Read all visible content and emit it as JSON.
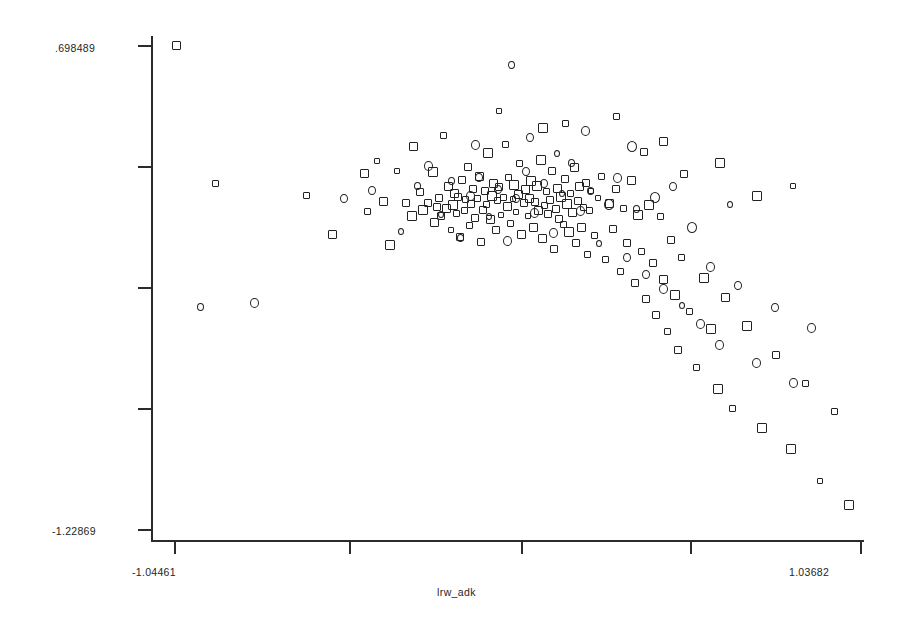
{
  "chart_data": {
    "type": "scatter",
    "title": "",
    "xlabel": "lrw_adk",
    "ylabel": "",
    "xlim": [
      -1.04461,
      1.03682
    ],
    "ylim": [
      -1.22869,
      0.698489
    ],
    "grid": false,
    "legend": "none",
    "x_tick_labels": [
      "-1.04461",
      "1.03682"
    ],
    "y_tick_labels": [
      ".698489",
      "-1.22869"
    ],
    "x_tick_count": 5,
    "y_tick_count": 5,
    "series": [
      {
        "name": "square-markers",
        "marker": "open-square",
        "points": [
          [
            -1.038,
            0.696
          ],
          [
            -0.92,
            0.149
          ],
          [
            -0.642,
            0.099
          ],
          [
            -0.565,
            -0.056
          ],
          [
            -0.468,
            0.185
          ],
          [
            -0.457,
            0.036
          ],
          [
            -0.428,
            0.238
          ],
          [
            -0.41,
            0.076
          ],
          [
            -0.389,
            -0.098
          ],
          [
            -0.368,
            0.198
          ],
          [
            -0.34,
            0.07
          ],
          [
            -0.321,
            0.018
          ],
          [
            -0.318,
            0.296
          ],
          [
            -0.299,
            0.115
          ],
          [
            -0.288,
            0.042
          ],
          [
            -0.274,
            0.071
          ],
          [
            -0.26,
            0.193
          ],
          [
            -0.254,
            -0.01
          ],
          [
            -0.248,
            0.054
          ],
          [
            -0.241,
            0.088
          ],
          [
            -0.233,
            0.017
          ],
          [
            -0.227,
            0.339
          ],
          [
            -0.218,
            0.049
          ],
          [
            -0.212,
            0.137
          ],
          [
            -0.205,
            -0.04
          ],
          [
            -0.198,
            0.06
          ],
          [
            -0.193,
            0.109
          ],
          [
            -0.188,
            0.029
          ],
          [
            -0.182,
            0.095
          ],
          [
            -0.176,
            -0.067
          ],
          [
            -0.17,
            0.161
          ],
          [
            -0.164,
            0.04
          ],
          [
            -0.159,
            0.082
          ],
          [
            -0.153,
            0.212
          ],
          [
            -0.148,
            -0.021
          ],
          [
            -0.142,
            0.066
          ],
          [
            -0.136,
            0.127
          ],
          [
            -0.131,
            0.011
          ],
          [
            -0.125,
            0.088
          ],
          [
            -0.119,
            0.175
          ],
          [
            -0.114,
            -0.084
          ],
          [
            -0.108,
            0.043
          ],
          [
            -0.102,
            0.118
          ],
          [
            -0.097,
            0.065
          ],
          [
            -0.091,
            0.269
          ],
          [
            -0.085,
            0.005
          ],
          [
            -0.08,
            0.097
          ],
          [
            -0.074,
            0.146
          ],
          [
            -0.068,
            -0.038
          ],
          [
            -0.063,
            0.079
          ],
          [
            -0.057,
            0.133
          ],
          [
            -0.051,
            0.022
          ],
          [
            -0.046,
            0.091
          ],
          [
            -0.04,
            0.301
          ],
          [
            -0.034,
            0.056
          ],
          [
            -0.029,
            0.169
          ],
          [
            -0.023,
            -0.012
          ],
          [
            -0.017,
            0.084
          ],
          [
            -0.012,
            0.142
          ],
          [
            -0.006,
            0.033
          ],
          [
            0.0,
            0.102
          ],
          [
            0.005,
            0.225
          ],
          [
            0.011,
            -0.055
          ],
          [
            0.017,
            0.068
          ],
          [
            0.022,
            0.124
          ],
          [
            0.028,
            0.016
          ],
          [
            0.034,
            0.087
          ],
          [
            0.039,
            0.158
          ],
          [
            0.045,
            -0.029
          ],
          [
            0.051,
            0.072
          ],
          [
            0.056,
            0.136
          ],
          [
            0.062,
            0.039
          ],
          [
            0.068,
            0.241
          ],
          [
            0.073,
            -0.073
          ],
          [
            0.079,
            0.059
          ],
          [
            0.085,
            0.115
          ],
          [
            0.09,
            0.024
          ],
          [
            0.096,
            0.081
          ],
          [
            0.102,
            0.197
          ],
          [
            0.107,
            -0.112
          ],
          [
            0.113,
            0.047
          ],
          [
            0.119,
            0.129
          ],
          [
            0.124,
            0.005
          ],
          [
            0.13,
            0.093
          ],
          [
            0.136,
            -0.018
          ],
          [
            0.141,
            0.163
          ],
          [
            0.147,
            0.064
          ],
          [
            0.153,
            -0.046
          ],
          [
            0.158,
            0.108
          ],
          [
            0.164,
            0.032
          ],
          [
            0.17,
            0.21
          ],
          [
            0.175,
            -0.091
          ],
          [
            0.181,
            0.076
          ],
          [
            0.187,
            0.135
          ],
          [
            0.192,
            -0.027
          ],
          [
            0.198,
            0.053
          ],
          [
            0.204,
            0.149
          ],
          [
            0.209,
            -0.134
          ],
          [
            0.215,
            0.041
          ],
          [
            0.221,
            0.118
          ],
          [
            0.232,
            -0.062
          ],
          [
            0.243,
            0.088
          ],
          [
            0.254,
            0.174
          ],
          [
            0.265,
            -0.157
          ],
          [
            0.276,
            0.069
          ],
          [
            0.287,
            -0.035
          ],
          [
            0.298,
            0.125
          ],
          [
            0.309,
            -0.204
          ],
          [
            0.32,
            0.046
          ],
          [
            0.331,
            -0.088
          ],
          [
            0.342,
            0.159
          ],
          [
            0.353,
            -0.248
          ],
          [
            0.364,
            0.021
          ],
          [
            0.375,
            -0.123
          ],
          [
            0.386,
            -0.312
          ],
          [
            0.397,
            0.062
          ],
          [
            0.408,
            -0.171
          ],
          [
            0.419,
            -0.378
          ],
          [
            0.43,
            0.014
          ],
          [
            0.441,
            -0.234
          ],
          [
            0.452,
            -0.441
          ],
          [
            0.463,
            -0.076
          ],
          [
            0.474,
            -0.295
          ],
          [
            0.485,
            -0.516
          ],
          [
            0.496,
            -0.148
          ],
          [
            0.518,
            -0.362
          ],
          [
            0.54,
            -0.584
          ],
          [
            0.562,
            -0.229
          ],
          [
            0.584,
            -0.433
          ],
          [
            0.606,
            -0.671
          ],
          [
            0.628,
            -0.305
          ],
          [
            0.65,
            -0.748
          ],
          [
            0.694,
            -0.419
          ],
          [
            0.738,
            -0.826
          ],
          [
            0.782,
            -0.534
          ],
          [
            0.826,
            -0.912
          ],
          [
            0.87,
            -0.648
          ],
          [
            0.914,
            -1.038
          ],
          [
            0.958,
            -0.762
          ],
          [
            1.002,
            -1.134
          ],
          [
            0.297,
            0.412
          ],
          [
            0.143,
            0.386
          ],
          [
            -0.058,
            0.434
          ],
          [
            0.074,
            0.368
          ],
          [
            0.381,
            0.274
          ],
          [
            0.442,
            0.315
          ],
          [
            0.503,
            0.186
          ],
          [
            0.613,
            0.227
          ],
          [
            0.724,
            0.098
          ],
          [
            0.835,
            0.139
          ]
        ]
      },
      {
        "name": "circle-markers",
        "marker": "open-circle",
        "points": [
          [
            -0.963,
            -0.346
          ],
          [
            -0.801,
            -0.328
          ],
          [
            -0.528,
            0.087
          ],
          [
            -0.443,
            0.118
          ],
          [
            -0.355,
            -0.043
          ],
          [
            -0.306,
            0.136
          ],
          [
            -0.272,
            0.218
          ],
          [
            -0.235,
            0.023
          ],
          [
            -0.202,
            0.155
          ],
          [
            -0.174,
            -0.069
          ],
          [
            -0.146,
            0.098
          ],
          [
            -0.118,
            0.172
          ],
          [
            -0.09,
            0.014
          ],
          [
            -0.062,
            0.124
          ],
          [
            -0.034,
            -0.081
          ],
          [
            -0.006,
            0.086
          ],
          [
            0.022,
            0.194
          ],
          [
            0.05,
            0.028
          ],
          [
            0.078,
            0.147
          ],
          [
            0.106,
            -0.052
          ],
          [
            0.134,
            0.108
          ],
          [
            0.162,
            0.229
          ],
          [
            0.19,
            0.039
          ],
          [
            0.218,
            0.119
          ],
          [
            0.246,
            -0.093
          ],
          [
            0.274,
            0.065
          ],
          [
            0.302,
            0.168
          ],
          [
            0.33,
            -0.148
          ],
          [
            0.358,
            0.046
          ],
          [
            0.386,
            -0.216
          ],
          [
            0.414,
            0.092
          ],
          [
            0.442,
            -0.274
          ],
          [
            0.47,
            0.136
          ],
          [
            0.498,
            -0.339
          ],
          [
            0.526,
            -0.028
          ],
          [
            0.554,
            -0.412
          ],
          [
            0.582,
            -0.184
          ],
          [
            0.61,
            -0.498
          ],
          [
            0.666,
            -0.261
          ],
          [
            0.722,
            -0.567
          ],
          [
            0.778,
            -0.348
          ],
          [
            0.834,
            -0.646
          ],
          [
            0.89,
            -0.429
          ],
          [
            -0.022,
            0.618
          ],
          [
            0.035,
            0.332
          ],
          [
            0.205,
            0.357
          ],
          [
            0.346,
            0.293
          ],
          [
            0.118,
            0.265
          ],
          [
            -0.13,
            0.302
          ],
          [
            0.642,
            0.062
          ]
        ]
      }
    ]
  },
  "axes": {
    "y_top_label": ".698489",
    "y_bottom_label": "-1.22869",
    "x_left_label": "-1.04461",
    "x_right_label": "1.03682",
    "x_title": "lrw_adk"
  },
  "style": {
    "marker_color": "#222222",
    "axis_color": "#2b2b2b",
    "background": "#ffffff"
  }
}
